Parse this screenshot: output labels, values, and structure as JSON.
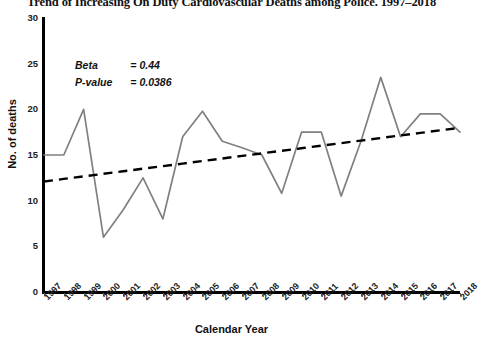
{
  "figure": {
    "title": "Trend of Increasing On Duty Cardiovascular Deaths among Police. 1997–2018",
    "xlabel": "Calendar Year",
    "ylabel": "No. of deaths"
  },
  "annotation": {
    "beta_key": "Beta",
    "beta_value": "= 0.44",
    "pvalue_key": "P-value",
    "pvalue_value": "= 0.0386"
  },
  "colors": {
    "series_line": "#808080",
    "trend_line": "#000000",
    "axis": "#000000",
    "text": "#111111"
  },
  "chart_data": {
    "type": "line",
    "title": "Trend of Increasing On Duty Cardiovascular Deaths among Police. 1997–2018",
    "xlabel": "Calendar Year",
    "ylabel": "No. of deaths",
    "ylim": [
      0,
      30
    ],
    "yticks": [
      0,
      5,
      10,
      15,
      20,
      25,
      30
    ],
    "grid": false,
    "legend": null,
    "x": [
      1997,
      1998,
      1999,
      2000,
      2001,
      2002,
      2003,
      2004,
      2005,
      2006,
      2007,
      2008,
      2009,
      2010,
      2011,
      2012,
      2013,
      2014,
      2015,
      2016,
      2017,
      2018
    ],
    "categories": [
      "1997",
      "1998",
      "1999",
      "2000",
      "2001",
      "2002",
      "2003",
      "2004",
      "2005",
      "2006",
      "2007",
      "2008",
      "2009",
      "2010",
      "2011",
      "2012",
      "2013",
      "2014",
      "2015",
      "2016",
      "2017",
      "2018"
    ],
    "series": [
      {
        "name": "On duty cardiovascular deaths",
        "style": "solid",
        "color": "#808080",
        "values": [
          15,
          15,
          20,
          6,
          9,
          12.5,
          8,
          17,
          19.8,
          16.5,
          15.8,
          15,
          10.8,
          17.5,
          17.5,
          10.5,
          16.5,
          23.5,
          17,
          19.5,
          19.5,
          17.5
        ]
      },
      {
        "name": "Linear trend",
        "style": "dashed",
        "color": "#000000",
        "values": [
          12.1,
          12.38,
          12.66,
          12.94,
          13.22,
          13.5,
          13.78,
          14.06,
          14.34,
          14.62,
          14.9,
          15.18,
          15.46,
          15.74,
          16.02,
          16.3,
          16.58,
          16.86,
          17.14,
          17.42,
          17.7,
          17.98
        ]
      }
    ],
    "annotations": [
      {
        "label": "Beta",
        "value": "= 0.44"
      },
      {
        "label": "P-value",
        "value": "= 0.0386"
      }
    ]
  }
}
